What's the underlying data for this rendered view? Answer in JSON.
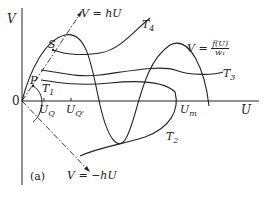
{
  "figure": {
    "panel_label": "(a)",
    "axes": {
      "y_label": "V",
      "x_label": "U",
      "origin": "0"
    },
    "lines": {
      "upper": "V = hU",
      "lower": "V = −hU"
    },
    "curve_label": {
      "prefix": "V = ",
      "numerator": "f(U)",
      "denominator": "w₁"
    },
    "points": {
      "S": "S",
      "P": "P"
    },
    "trajectories": [
      "T1",
      "T2",
      "T3",
      "T4"
    ],
    "x_ticks": {
      "UQ": "U",
      "UQ_sub": "Q",
      "UQp": "U",
      "UQp_sub": "Q'",
      "Um": "U",
      "Um_sub": "m"
    },
    "t_labels": {
      "T": "T",
      "s1": "1",
      "s2": "2",
      "s3": "3",
      "s4": "4"
    },
    "colors": {
      "ink": "#222222",
      "background": "#ffffff"
    }
  }
}
